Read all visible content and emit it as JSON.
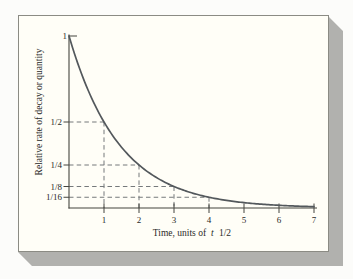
{
  "figure": {
    "background": "#fcfcfa",
    "card_fill": "#fffef7",
    "card_border": "#8b8b84",
    "shadow_color": "#b1b1ae"
  },
  "chart_data": {
    "type": "line",
    "title": "",
    "xlabel": "Time, units of t 1/2",
    "xlabel_parts": {
      "before": "Time, units of",
      "italic": "t",
      "after": "1/2"
    },
    "ylabel": "Relative rate of decay or quantity",
    "xlim": [
      0,
      7
    ],
    "ylim": [
      0,
      1
    ],
    "grid": false,
    "legend": false,
    "curve_formula": "y = (1/2)^x",
    "decay_factor_per_unit": 0.5,
    "x_ticks": [
      1,
      2,
      3,
      4,
      5,
      6,
      7
    ],
    "x_tick_labels": [
      "1",
      "2",
      "3",
      "4",
      "5",
      "6",
      "7"
    ],
    "y_ticks": [
      {
        "label": "1",
        "value": 1
      },
      {
        "label": "1/2",
        "value": 0.5
      },
      {
        "label": "1/4",
        "value": 0.25
      },
      {
        "label": "1/8",
        "value": 0.125
      },
      {
        "label": "1/16",
        "value": 0.0625
      }
    ],
    "guide_points": [
      {
        "x": 1,
        "y": 0.5
      },
      {
        "x": 2,
        "y": 0.25
      },
      {
        "x": 3,
        "y": 0.125
      },
      {
        "x": 4,
        "y": 0.0625
      }
    ],
    "series": [
      {
        "name": "relative rate of decay",
        "x": [
          0,
          1,
          2,
          3,
          4,
          5,
          6,
          7
        ],
        "y": [
          1,
          0.5,
          0.25,
          0.125,
          0.0625,
          0.03125,
          0.015625,
          0.0078125
        ]
      }
    ],
    "colors": {
      "curve": "#53585c",
      "axis": "#44443f",
      "dashed": "#75797b",
      "text": "#2a2a28"
    }
  }
}
